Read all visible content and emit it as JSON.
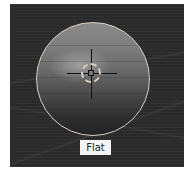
{
  "viewport": {
    "shading_label": "Flat",
    "colors": {
      "background": "#2a2a2a",
      "sphere_outline": "#d8cfc0",
      "label_bg": "#f4f4f4"
    }
  },
  "icons": {
    "cursor": "3d-cursor-crosshair"
  }
}
